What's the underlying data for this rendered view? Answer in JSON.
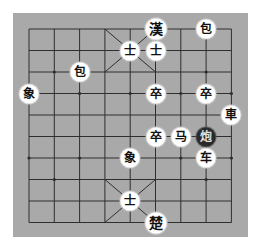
{
  "board": {
    "type": "xiangqi",
    "background_color": "#a9a9a9",
    "line_color": "#2e2e2e",
    "columns": 9,
    "rows": 10
  },
  "pieces": [
    {
      "label": "漢",
      "col": 5,
      "row": 0,
      "side": "black",
      "role": "general",
      "big": true
    },
    {
      "label": "包",
      "col": 7,
      "row": 0,
      "side": "black",
      "role": "cannon"
    },
    {
      "label": "士",
      "col": 4,
      "row": 1,
      "side": "black",
      "role": "advisor"
    },
    {
      "label": "士",
      "col": 5,
      "row": 1,
      "side": "black",
      "role": "advisor"
    },
    {
      "label": "包",
      "col": 2,
      "row": 2,
      "side": "black",
      "role": "cannon"
    },
    {
      "label": "象",
      "col": 0,
      "row": 3,
      "side": "black",
      "role": "elephant"
    },
    {
      "label": "卒",
      "col": 5,
      "row": 3,
      "side": "black",
      "role": "soldier"
    },
    {
      "label": "卒",
      "col": 7,
      "row": 3,
      "side": "black",
      "role": "soldier"
    },
    {
      "label": "車",
      "col": 8,
      "row": 4,
      "side": "black",
      "role": "chariot"
    },
    {
      "label": "卒",
      "col": 5,
      "row": 5,
      "side": "black",
      "role": "soldier"
    },
    {
      "label": "马",
      "col": 6,
      "row": 5,
      "side": "red",
      "role": "horse"
    },
    {
      "label": "炮",
      "col": 7,
      "row": 5,
      "side": "red",
      "role": "cannon",
      "dark": true
    },
    {
      "label": "象",
      "col": 4,
      "row": 6,
      "side": "red",
      "role": "elephant"
    },
    {
      "label": "车",
      "col": 7,
      "row": 6,
      "side": "red",
      "role": "chariot"
    },
    {
      "label": "士",
      "col": 4,
      "row": 8,
      "side": "red",
      "role": "advisor"
    },
    {
      "label": "楚",
      "col": 5,
      "row": 9,
      "side": "red",
      "role": "general",
      "big": true
    }
  ]
}
